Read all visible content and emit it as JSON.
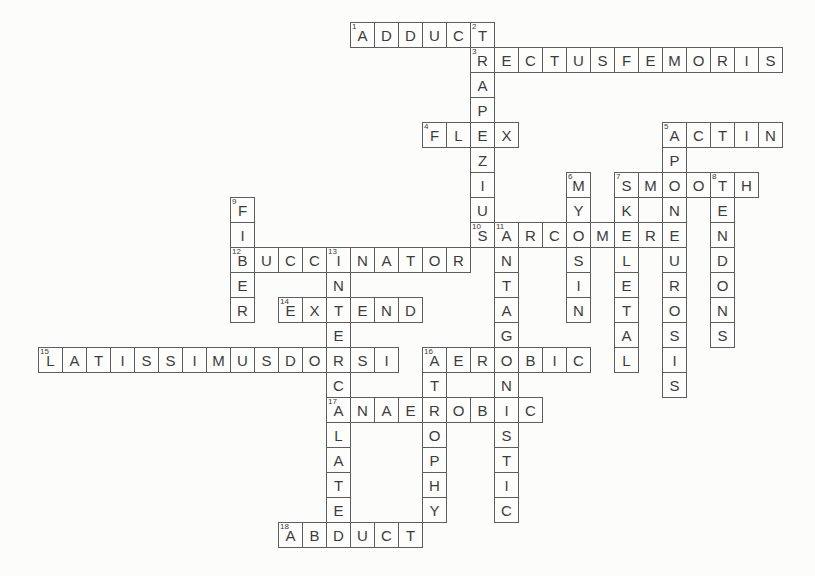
{
  "colors": {
    "grid_line": "#5e5e5e",
    "letter": "#3c3c3c",
    "background": "#fcfcfb"
  },
  "puzzle": {
    "kind": "crossword",
    "rows": 21,
    "cols": 31,
    "words": [
      {
        "number": 1,
        "direction": "across",
        "row": 0,
        "col": 13,
        "answer": "ADDUCT"
      },
      {
        "number": 2,
        "direction": "down",
        "row": 0,
        "col": 18,
        "answer": "TRAPEZIUS"
      },
      {
        "number": 3,
        "direction": "across",
        "row": 1,
        "col": 18,
        "answer": "RECTUSFEMORIS"
      },
      {
        "number": 4,
        "direction": "across",
        "row": 4,
        "col": 16,
        "answer": "FLEX"
      },
      {
        "number": 5,
        "direction": "across",
        "row": 4,
        "col": 26,
        "answer": "ACTIN"
      },
      {
        "number": 5,
        "direction": "down",
        "row": 4,
        "col": 26,
        "answer": "APONEUROSIS"
      },
      {
        "number": 6,
        "direction": "down",
        "row": 6,
        "col": 22,
        "answer": "MYOSIN"
      },
      {
        "number": 7,
        "direction": "across",
        "row": 6,
        "col": 24,
        "answer": "SMOOTH"
      },
      {
        "number": 7,
        "direction": "down",
        "row": 6,
        "col": 24,
        "answer": "SKELETAL"
      },
      {
        "number": 8,
        "direction": "down",
        "row": 6,
        "col": 28,
        "answer": "TENDONS"
      },
      {
        "number": 9,
        "direction": "down",
        "row": 7,
        "col": 8,
        "answer": "FIBER"
      },
      {
        "number": 10,
        "direction": "across",
        "row": 8,
        "col": 18,
        "answer": "SARCOMERE"
      },
      {
        "number": 11,
        "direction": "down",
        "row": 8,
        "col": 19,
        "answer": "ANTAGONISTIC"
      },
      {
        "number": 12,
        "direction": "across",
        "row": 9,
        "col": 8,
        "answer": "BUCCINATOR"
      },
      {
        "number": 13,
        "direction": "down",
        "row": 9,
        "col": 12,
        "answer": "INTERCALATED"
      },
      {
        "number": 14,
        "direction": "across",
        "row": 11,
        "col": 10,
        "answer": "EXTEND"
      },
      {
        "number": 15,
        "direction": "across",
        "row": 13,
        "col": 0,
        "answer": "LATISSIMUSDORSI"
      },
      {
        "number": 16,
        "direction": "across",
        "row": 13,
        "col": 16,
        "answer": "AEROBIC"
      },
      {
        "number": 16,
        "direction": "down",
        "row": 13,
        "col": 16,
        "answer": "ATROPHY"
      },
      {
        "number": 17,
        "direction": "across",
        "row": 15,
        "col": 12,
        "answer": "ANAEROBIC"
      },
      {
        "number": 18,
        "direction": "across",
        "row": 20,
        "col": 10,
        "answer": "ABDUCT"
      }
    ]
  }
}
